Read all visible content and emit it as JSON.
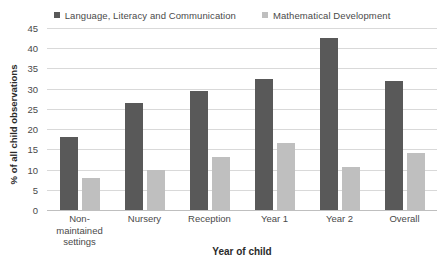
{
  "chart_data": {
    "type": "bar",
    "title": "",
    "xlabel": "Year of child",
    "ylabel": "% of all child observations",
    "categories": [
      "Non-maintained settings",
      "Nursery",
      "Reception",
      "Year 1",
      "Year 2",
      "Overall"
    ],
    "series": [
      {
        "name": "Language, Literacy and Communication",
        "color": "#595959",
        "values": [
          18,
          26.5,
          29.5,
          32.5,
          42.5,
          32
        ]
      },
      {
        "name": "Mathematical Development",
        "color": "#bfbfbf",
        "values": [
          8,
          10,
          13,
          16.5,
          10.7,
          14
        ]
      }
    ],
    "ylim": [
      0,
      45
    ],
    "ytick_step": 5,
    "yticks": [
      "0",
      "5",
      "10",
      "15",
      "20",
      "25",
      "30",
      "35",
      "40",
      "45"
    ],
    "grid": true,
    "legend_position": "top"
  },
  "legend": {
    "entries": [
      {
        "label": "Language, Literacy and Communication",
        "swatch_color": "#595959"
      },
      {
        "label": "Mathematical Development",
        "swatch_color": "#bfbfbf"
      }
    ]
  },
  "colors": {
    "series_dark": "#595959",
    "series_light": "#bfbfbf",
    "gridline": "#d9d9d9",
    "axis": "#bfbfbf",
    "text": "#4a4a4a",
    "title_text": "#2b2b2b",
    "background": "#ffffff"
  }
}
